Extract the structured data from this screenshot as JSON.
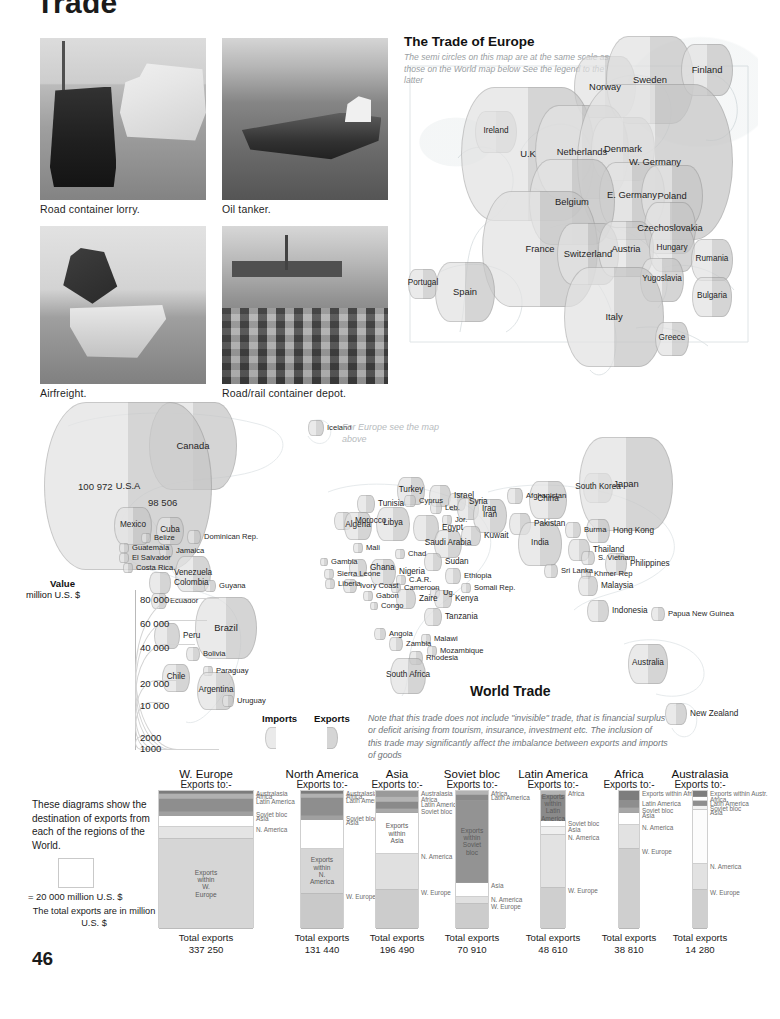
{
  "page": {
    "title": "Trade",
    "number": "46"
  },
  "photos": [
    {
      "caption": "Road container lorry.",
      "icon": "lorry-ship-photo"
    },
    {
      "caption": "Oil tanker.",
      "icon": "tanker-photo"
    },
    {
      "caption": "Airfreight.",
      "icon": "airfreight-photo"
    },
    {
      "caption": "Road/rail container depot.",
      "icon": "container-depot-photo"
    }
  ],
  "europe_map": {
    "title": "The Trade of Europe",
    "note": "The semi circles on this map are at the same scale as those on the World map below  See the legend to the latter",
    "countries": [
      {
        "name": "Norway",
        "x": 205,
        "y": 55,
        "r": 31
      },
      {
        "name": "Sweden",
        "x": 250,
        "y": 48,
        "r": 44
      },
      {
        "name": "Finland",
        "x": 307,
        "y": 38,
        "r": 26
      },
      {
        "name": "Ireland",
        "x": 96,
        "y": 100,
        "r": 21
      },
      {
        "name": "U.K",
        "x": 128,
        "y": 122,
        "r": 67
      },
      {
        "name": "Netherlands",
        "x": 182,
        "y": 120,
        "r": 47
      },
      {
        "name": "Denmark",
        "x": 223,
        "y": 117,
        "r": 32
      },
      {
        "name": "W. Germany",
        "x": 255,
        "y": 130,
        "r": 78
      },
      {
        "name": "E. Germany",
        "x": 232,
        "y": 163,
        "r": 33
      },
      {
        "name": "Poland",
        "x": 272,
        "y": 164,
        "r": 31
      },
      {
        "name": "Belgium",
        "x": 172,
        "y": 170,
        "r": 43
      },
      {
        "name": "Czechoslovakia",
        "x": 270,
        "y": 196,
        "r": 26
      },
      {
        "name": "France",
        "x": 140,
        "y": 217,
        "r": 58
      },
      {
        "name": "Switzerland",
        "x": 188,
        "y": 222,
        "r": 31
      },
      {
        "name": "Austria",
        "x": 226,
        "y": 217,
        "r": 28
      },
      {
        "name": "Hungary",
        "x": 272,
        "y": 217,
        "r": 23
      },
      {
        "name": "Rumania",
        "x": 312,
        "y": 228,
        "r": 21
      },
      {
        "name": "Portugal",
        "x": 23,
        "y": 252,
        "r": 15
      },
      {
        "name": "Spain",
        "x": 65,
        "y": 260,
        "r": 30
      },
      {
        "name": "Yugoslavia",
        "x": 262,
        "y": 248,
        "r": 22
      },
      {
        "name": "Bulgaria",
        "x": 312,
        "y": 265,
        "r": 20
      },
      {
        "name": "Italy",
        "x": 214,
        "y": 285,
        "r": 50
      },
      {
        "name": "Greece",
        "x": 272,
        "y": 307,
        "r": 17
      }
    ]
  },
  "world_map": {
    "title": "World Trade",
    "note": "Note that this trade does not include \"invisible\" trade, that is financial surplus or deficit arising from tourism, insurance, investment etc.  The inclusion of this trade may significantly affect the  imbalance between exports and imports of goods",
    "europe_pointer": "For Europe see the map above",
    "usa_import_value": "100 972",
    "usa_export_value": "98 506",
    "countries": [
      {
        "name": "Canada",
        "x": 165,
        "y": 50,
        "r": 44
      },
      {
        "name": "U.S.A",
        "x": 100,
        "y": 90,
        "r": 84
      },
      {
        "name": "Iceland",
        "x": 288,
        "y": 32,
        "r": 8
      },
      {
        "name": "Mexico",
        "x": 105,
        "y": 130,
        "r": 19
      },
      {
        "name": "Cuba",
        "x": 142,
        "y": 135,
        "r": 14
      },
      {
        "name": "Belize",
        "x": 118,
        "y": 142,
        "r": 5
      },
      {
        "name": "Dominican Rep.",
        "x": 166,
        "y": 141,
        "r": 7
      },
      {
        "name": "Guatemala",
        "x": 96,
        "y": 152,
        "r": 5
      },
      {
        "name": "Jamaica",
        "x": 138,
        "y": 155,
        "r": 7
      },
      {
        "name": "El Salvador",
        "x": 96,
        "y": 162,
        "r": 5
      },
      {
        "name": "Costa Rica",
        "x": 100,
        "y": 172,
        "r": 5
      },
      {
        "name": "Venezuela",
        "x": 165,
        "y": 178,
        "r": 18
      },
      {
        "name": "Colombia",
        "x": 132,
        "y": 187,
        "r": 11
      },
      {
        "name": "Guyana",
        "x": 182,
        "y": 190,
        "r": 6
      },
      {
        "name": "Ecuador",
        "x": 131,
        "y": 205,
        "r": 8
      },
      {
        "name": "Brazil",
        "x": 198,
        "y": 232,
        "r": 31
      },
      {
        "name": "Peru",
        "x": 139,
        "y": 240,
        "r": 13
      },
      {
        "name": "Bolivia",
        "x": 165,
        "y": 258,
        "r": 7
      },
      {
        "name": "Paraguay",
        "x": 180,
        "y": 275,
        "r": 5
      },
      {
        "name": "Chile",
        "x": 148,
        "y": 282,
        "r": 14
      },
      {
        "name": "Argentina",
        "x": 188,
        "y": 295,
        "r": 19
      },
      {
        "name": "Uruguay",
        "x": 200,
        "y": 305,
        "r": 6
      },
      {
        "name": "Morocco",
        "x": 315,
        "y": 125,
        "r": 9
      },
      {
        "name": "Tunisia",
        "x": 338,
        "y": 108,
        "r": 9
      },
      {
        "name": "Algeria",
        "x": 330,
        "y": 130,
        "r": 14
      },
      {
        "name": "Libya",
        "x": 365,
        "y": 128,
        "r": 17
      },
      {
        "name": "Egypt",
        "x": 398,
        "y": 132,
        "r": 13
      },
      {
        "name": "Turkey",
        "x": 383,
        "y": 95,
        "r": 14
      },
      {
        "name": "Cyprus",
        "x": 382,
        "y": 105,
        "r": 6
      },
      {
        "name": "Israel",
        "x": 412,
        "y": 100,
        "r": 11
      },
      {
        "name": "Leb.",
        "x": 408,
        "y": 112,
        "r": 6
      },
      {
        "name": "Syria",
        "x": 429,
        "y": 106,
        "r": 9
      },
      {
        "name": "Iraq",
        "x": 440,
        "y": 113,
        "r": 11
      },
      {
        "name": "Jor.",
        "x": 419,
        "y": 124,
        "r": 5
      },
      {
        "name": "Iran",
        "x": 462,
        "y": 120,
        "r": 17
      },
      {
        "name": "Kuwait",
        "x": 443,
        "y": 140,
        "r": 10
      },
      {
        "name": "Saudi Arabia",
        "x": 420,
        "y": 148,
        "r": 14
      },
      {
        "name": "Afghanistan",
        "x": 487,
        "y": 100,
        "r": 8
      },
      {
        "name": "Pakistan",
        "x": 492,
        "y": 128,
        "r": 11
      },
      {
        "name": "India",
        "x": 512,
        "y": 148,
        "r": 22
      },
      {
        "name": "China",
        "x": 520,
        "y": 104,
        "r": 19
      },
      {
        "name": "Burma",
        "x": 545,
        "y": 134,
        "r": 8
      },
      {
        "name": "Thailand",
        "x": 551,
        "y": 154,
        "r": 11
      },
      {
        "name": "Sri Lanka",
        "x": 523,
        "y": 175,
        "r": 7
      },
      {
        "name": "Mali",
        "x": 330,
        "y": 152,
        "r": 5
      },
      {
        "name": "Chad",
        "x": 372,
        "y": 158,
        "r": 5
      },
      {
        "name": "Sudan",
        "x": 405,
        "y": 166,
        "r": 9
      },
      {
        "name": "Gambia",
        "x": 296,
        "y": 166,
        "r": 4
      },
      {
        "name": "Ghana",
        "x": 330,
        "y": 172,
        "r": 9
      },
      {
        "name": "Sierra Leone",
        "x": 301,
        "y": 178,
        "r": 5
      },
      {
        "name": "Nigeria",
        "x": 355,
        "y": 176,
        "r": 13
      },
      {
        "name": "Ethiopia",
        "x": 425,
        "y": 180,
        "r": 8
      },
      {
        "name": "Liberia",
        "x": 302,
        "y": 188,
        "r": 5
      },
      {
        "name": "Ivory Coast",
        "x": 322,
        "y": 190,
        "r": 7
      },
      {
        "name": "C.A.R.",
        "x": 373,
        "y": 184,
        "r": 5
      },
      {
        "name": "Cameroon",
        "x": 368,
        "y": 192,
        "r": 5
      },
      {
        "name": "Somali Rep.",
        "x": 438,
        "y": 192,
        "r": 5
      },
      {
        "name": "Gabon",
        "x": 340,
        "y": 200,
        "r": 5
      },
      {
        "name": "Zaire",
        "x": 378,
        "y": 203,
        "r": 10
      },
      {
        "name": "Ug.",
        "x": 407,
        "y": 197,
        "r": 5
      },
      {
        "name": "Kenya",
        "x": 415,
        "y": 203,
        "r": 9
      },
      {
        "name": "Congo",
        "x": 346,
        "y": 210,
        "r": 4
      },
      {
        "name": "Tanzania",
        "x": 405,
        "y": 221,
        "r": 9
      },
      {
        "name": "Angola",
        "x": 352,
        "y": 238,
        "r": 6
      },
      {
        "name": "Zambia",
        "x": 368,
        "y": 248,
        "r": 7
      },
      {
        "name": "Malawi",
        "x": 398,
        "y": 243,
        "r": 5
      },
      {
        "name": "Mozambique",
        "x": 404,
        "y": 255,
        "r": 5
      },
      {
        "name": "Rhodesia",
        "x": 388,
        "y": 262,
        "r": 7
      },
      {
        "name": "South Africa",
        "x": 380,
        "y": 280,
        "r": 18
      },
      {
        "name": "South Korea",
        "x": 570,
        "y": 92,
        "r": 15
      },
      {
        "name": "Japan",
        "x": 598,
        "y": 88,
        "r": 47
      },
      {
        "name": "Hong Kong",
        "x": 570,
        "y": 135,
        "r": 12
      },
      {
        "name": "S. Vietnam",
        "x": 560,
        "y": 162,
        "r": 7
      },
      {
        "name": "Khmer Rep",
        "x": 558,
        "y": 178,
        "r": 5
      },
      {
        "name": "Philippines",
        "x": 588,
        "y": 168,
        "r": 11
      },
      {
        "name": "Malaysia",
        "x": 560,
        "y": 190,
        "r": 10
      },
      {
        "name": "Indonesia",
        "x": 570,
        "y": 215,
        "r": 11
      },
      {
        "name": "Papua New Guinea",
        "x": 630,
        "y": 218,
        "r": 7
      },
      {
        "name": "Australia",
        "x": 620,
        "y": 268,
        "r": 20
      },
      {
        "name": "New Zealand",
        "x": 648,
        "y": 318,
        "r": 11
      }
    ],
    "legend": {
      "title": "Value",
      "subtitle": "million U.S. $",
      "ticks": [
        "80 000",
        "60 000",
        "40 000",
        "20 000",
        "10 000",
        "2000",
        "1000"
      ],
      "imports_label": "Imports",
      "exports_label": "Exports"
    }
  },
  "bars": {
    "intro": "These diagrams show the destination of exports from each of the regions of the World.",
    "scale_equals": "= 20 000 million U.S. $",
    "scale_note": "The total exports are in million U.S. $",
    "total_label": "Total exports",
    "exports_to_label": "Exports to:-",
    "colors": {
      "w_europe": "#d2d2d2",
      "n_america": "#e0e0e0",
      "asia": "#ffffff",
      "soviet_bloc": "#8e8e8e",
      "latin_america": "#9c9c9c",
      "africa": "#b6b6b6",
      "australasia": "#7c7c7c",
      "within": "#dadada"
    },
    "columns": [
      {
        "region": "W. Europe",
        "total": "337 250",
        "segments": [
          {
            "label": "Australasia",
            "value": 2,
            "color": "#7c7c7c",
            "inside": false
          },
          {
            "label": "Africa",
            "value": 4,
            "color": "#b1b1b1",
            "inside": false
          },
          {
            "label": "Latin America",
            "value": 9,
            "color": "#8e8e8e",
            "inside": false
          },
          {
            "label": "Soviet bloc",
            "value": 3,
            "color": "#a0a0a0",
            "inside": false
          },
          {
            "label": "Asia",
            "value": 8,
            "color": "#ffffff",
            "inside": false
          },
          {
            "label": "N. America",
            "value": 9,
            "color": "#e4e4e4",
            "inside": false
          },
          {
            "label": "Exports within W. Europe",
            "value": 65,
            "color": "#d6d6d6",
            "inside": true
          }
        ]
      },
      {
        "region": "North America",
        "total": "131 440",
        "segments": [
          {
            "label": "Australasia",
            "value": 2,
            "color": "#7c7c7c",
            "inside": false
          },
          {
            "label": "Africa",
            "value": 3,
            "color": "#b1b1b1",
            "inside": false
          },
          {
            "label": "Latin America",
            "value": 13,
            "color": "#8e8e8e",
            "inside": false
          },
          {
            "label": "Soviet bloc",
            "value": 3,
            "color": "#a0a0a0",
            "inside": false
          },
          {
            "label": "Asia",
            "value": 21,
            "color": "#ffffff",
            "inside": false
          },
          {
            "label": "Exports within N. America",
            "value": 33,
            "color": "#d6d6d6",
            "inside": true
          },
          {
            "label": "W. Europe",
            "value": 25,
            "color": "#c9c9c9",
            "inside": false
          }
        ]
      },
      {
        "region": "Asia",
        "total": "196 490",
        "segments": [
          {
            "label": "Australasia",
            "value": 4,
            "color": "#9a9a9a",
            "inside": false
          },
          {
            "label": "Africa",
            "value": 4,
            "color": "#b4b4b4",
            "inside": false
          },
          {
            "label": "Latin America",
            "value": 5,
            "color": "#8a8a8a",
            "inside": false
          },
          {
            "label": "Soviet bloc",
            "value": 3,
            "color": "#a8a8a8",
            "inside": false
          },
          {
            "label": "Exports within Asia",
            "value": 30,
            "color": "#ffffff",
            "inside": true
          },
          {
            "label": "N. America",
            "value": 26,
            "color": "#e0e0e0",
            "inside": false
          },
          {
            "label": "W. Europe",
            "value": 28,
            "color": "#cccccc",
            "inside": false
          }
        ]
      },
      {
        "region": "Soviet bloc",
        "total": "70 910",
        "segments": [
          {
            "label": "Africa",
            "value": 3,
            "color": "#b4b4b4",
            "inside": false
          },
          {
            "label": "Latin America",
            "value": 4,
            "color": "#8a8a8a",
            "inside": false
          },
          {
            "label": "Exports within Soviet bloc",
            "value": 60,
            "color": "#939393",
            "inside": true
          },
          {
            "label": "Asia",
            "value": 10,
            "color": "#ffffff",
            "inside": false
          },
          {
            "label": "N. America",
            "value": 5,
            "color": "#e0e0e0",
            "inside": false
          },
          {
            "label": "W. Europe",
            "value": 18,
            "color": "#cccccc",
            "inside": false
          }
        ]
      },
      {
        "region": "Latin America",
        "total": "48 610",
        "segments": [
          {
            "label": "Africa",
            "value": 3,
            "color": "#b4b4b4",
            "inside": false
          },
          {
            "label": "Exports within Latin America",
            "value": 19,
            "color": "#8a8a8a",
            "inside": true
          },
          {
            "label": "Soviet bloc",
            "value": 4,
            "color": "#ffffff",
            "inside": false
          },
          {
            "label": "Asia",
            "value": 6,
            "color": "#efefef",
            "inside": false
          },
          {
            "label": "N. America",
            "value": 38,
            "color": "#e2e2e2",
            "inside": false
          },
          {
            "label": "W. Europe",
            "value": 30,
            "color": "#cfcfcf",
            "inside": false
          }
        ]
      },
      {
        "region": "Africa",
        "total": "38 810",
        "segments": [
          {
            "label": "Exports within Africa",
            "value": 7,
            "color": "#7d7d7d",
            "inside": false
          },
          {
            "label": "Latin America",
            "value": 5,
            "color": "#8e8e8e",
            "inside": false
          },
          {
            "label": "Soviet bloc",
            "value": 4,
            "color": "#a6a6a6",
            "inside": false
          },
          {
            "label": "Asia",
            "value": 9,
            "color": "#ffffff",
            "inside": false
          },
          {
            "label": "N. America",
            "value": 17,
            "color": "#e2e2e2",
            "inside": false
          },
          {
            "label": "W. Europe",
            "value": 58,
            "color": "#cfcfcf",
            "inside": false
          }
        ]
      },
      {
        "region": "Australasia",
        "total": "14 280",
        "segments": [
          {
            "label": "Exports within Austr.",
            "value": 4,
            "color": "#7d7d7d",
            "inside": false
          },
          {
            "label": "Africa",
            "value": 3,
            "color": "#ffffff",
            "inside": false
          },
          {
            "label": "Latin America",
            "value": 4,
            "color": "#8e8e8e",
            "inside": false
          },
          {
            "label": "Soviet bloc",
            "value": 3,
            "color": "#f2f2f2",
            "inside": false
          },
          {
            "label": "Asia",
            "value": 39,
            "color": "#fcfcfc",
            "inside": false
          },
          {
            "label": "N. America",
            "value": 19,
            "color": "#e2e2e2",
            "inside": false
          },
          {
            "label": "W. Europe",
            "value": 28,
            "color": "#cfcfcf",
            "inside": false
          }
        ]
      }
    ]
  }
}
